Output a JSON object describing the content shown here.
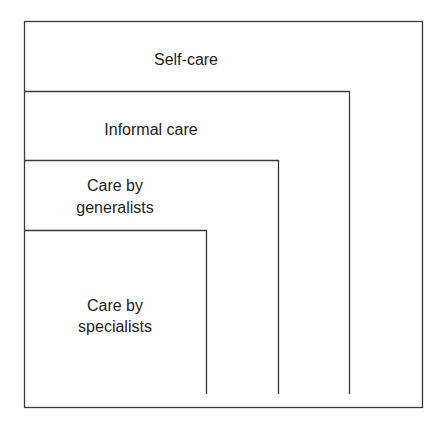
{
  "diagram": {
    "levels": [
      {
        "id": "self-care",
        "lines": [
          "Self-care"
        ]
      },
      {
        "id": "informal-care",
        "lines": [
          "Informal care"
        ]
      },
      {
        "id": "care-by-generalists",
        "lines": [
          "Care by",
          "generalists"
        ]
      },
      {
        "id": "care-by-specialists",
        "lines": [
          "Care by",
          "specialists"
        ]
      }
    ],
    "colors": {
      "line": "#3a3a3a",
      "text": "#1e1e1e",
      "background": "#ffffff"
    }
  }
}
